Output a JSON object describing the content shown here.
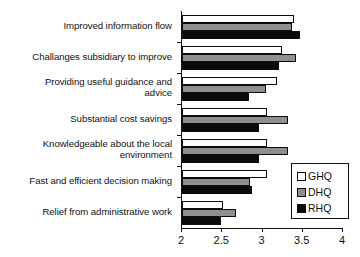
{
  "chart_data": {
    "type": "bar",
    "orientation": "horizontal",
    "title": "",
    "subtitle": "",
    "xlabel": "",
    "ylabel": "",
    "xlim": [
      2,
      4
    ],
    "xticks": [
      2,
      2.5,
      3,
      3.5,
      4
    ],
    "xtick_labels": [
      "2",
      "2.5",
      "3",
      "3.5",
      "4"
    ],
    "grid": false,
    "legend_position": "inside-bottom-right",
    "categories": [
      "Improved information flow",
      "Challanges subsidiary to improve",
      "Providing useful guidance and\nadvice",
      "Substantial cost savings",
      "Knowledgeable about the local\nenvironment",
      "Fast and efficient decision making",
      "Relief from administrative work"
    ],
    "series": [
      {
        "name": "GHQ",
        "color": "#ffffff",
        "values": [
          3.39,
          3.24,
          3.18,
          3.05,
          3.05,
          3.05,
          2.51
        ]
      },
      {
        "name": "DHQ",
        "color": "#8f8f8f",
        "values": [
          3.37,
          3.42,
          3.04,
          3.32,
          3.32,
          2.85,
          2.67
        ]
      },
      {
        "name": "RHQ",
        "color": "#0a0a0a",
        "values": [
          3.46,
          3.2,
          2.83,
          2.96,
          2.96,
          2.87,
          2.49
        ]
      }
    ]
  },
  "legend": {
    "entries": [
      {
        "label": "GHQ",
        "swatch": "white-square-swatch"
      },
      {
        "label": "DHQ",
        "swatch": "gray-square-swatch"
      },
      {
        "label": "RHQ",
        "swatch": "black-square-swatch"
      }
    ]
  },
  "axis": {
    "x_tick_labels": [
      "2",
      "2.5",
      "3",
      "3.5",
      "4"
    ]
  }
}
